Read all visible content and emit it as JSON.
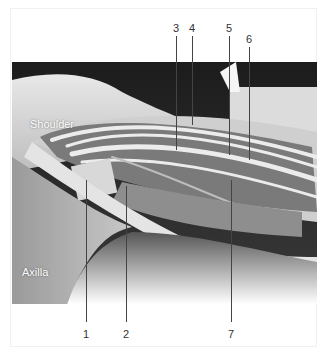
{
  "figure": {
    "region_labels": {
      "shoulder": "Shoulder",
      "axilla": "Axilla"
    },
    "callouts": [
      {
        "number": "1",
        "x": 86,
        "text_y": 328,
        "line_top": 180,
        "line_bottom": 322
      },
      {
        "number": "2",
        "x": 126,
        "text_y": 328,
        "line_top": 186,
        "line_bottom": 322
      },
      {
        "number": "3",
        "x": 176,
        "text_y": 24,
        "line_top": 36,
        "line_bottom": 150
      },
      {
        "number": "4",
        "x": 192,
        "text_y": 24,
        "line_top": 36,
        "line_bottom": 125
      },
      {
        "number": "5",
        "x": 229,
        "text_y": 24,
        "line_top": 36,
        "line_bottom": 155
      },
      {
        "number": "6",
        "x": 249,
        "text_y": 35,
        "line_top": 47,
        "line_bottom": 160
      },
      {
        "number": "7",
        "x": 231,
        "text_y": 328,
        "line_top": 180,
        "line_bottom": 322
      }
    ]
  }
}
